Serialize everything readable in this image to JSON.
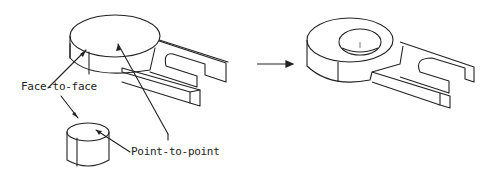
{
  "diagram": {
    "labels": {
      "face_to_face": "Face-to-face",
      "point_to_point": "Point-to-point"
    },
    "parts": [
      "base-plate-with-slot",
      "cylinder-peg",
      "assembled-result"
    ],
    "arrow": "transform-arrow",
    "stroke_color": "#222222"
  }
}
